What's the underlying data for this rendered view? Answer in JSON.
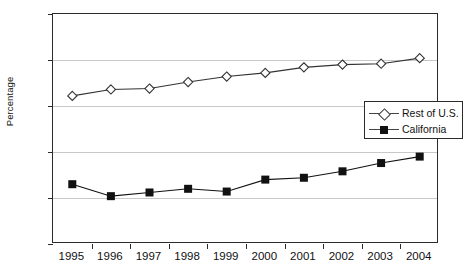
{
  "chart_data": {
    "type": "line",
    "title": "",
    "subtitle": "",
    "xlabel": "",
    "ylabel": "Percentage",
    "categories": [
      "1995",
      "1996",
      "1997",
      "1998",
      "1999",
      "2000",
      "2001",
      "2002",
      "2003",
      "2004"
    ],
    "series": [
      {
        "name": "Rest of U.S.",
        "marker": "open-diamond",
        "color": "#333333",
        "values": [
          66.1,
          66.8,
          66.9,
          67.6,
          68.2,
          68.6,
          69.2,
          69.5,
          69.6,
          70.2
        ]
      },
      {
        "name": "California",
        "marker": "filled-square",
        "color": "#111111",
        "values": [
          56.5,
          55.2,
          55.6,
          56.0,
          55.7,
          57.0,
          57.2,
          57.9,
          58.8,
          59.5
        ]
      }
    ],
    "ylim": [
      50,
      75
    ],
    "y_ticks": [
      50,
      55,
      60,
      65,
      70,
      75
    ],
    "y_tick_labels": [
      "50",
      "55",
      "60",
      "65",
      "70",
      "75"
    ],
    "grid": true,
    "grid_axis": "y",
    "legend_position": "center-right",
    "legend_entries": [
      "Rest of U.S.",
      "California"
    ]
  },
  "colors": {
    "frame": "#2b2b2b",
    "grid": "#c8c8c8",
    "background": "#ffffff",
    "text": "#111111"
  }
}
